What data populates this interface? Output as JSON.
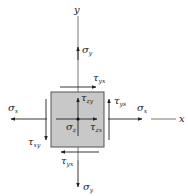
{
  "diagram": {
    "type": "stress-element",
    "axes": {
      "y_label": "y",
      "x_label": "x"
    },
    "element": {
      "fill": "#c8c8c8",
      "stroke": "#555555"
    },
    "labels": {
      "sigma_y_top": {
        "sym": "σ",
        "sub": "y"
      },
      "tau_yx_top": {
        "sym": "τ",
        "sub": "yx"
      },
      "tau_zy": {
        "sym": "τ",
        "sub": "zy"
      },
      "tau_ys": {
        "sym": "τ",
        "sub": "ys"
      },
      "sigma_x_right": {
        "sym": "σ",
        "sub": "x"
      },
      "sigma_x_left": {
        "sym": "σ",
        "sub": "x"
      },
      "sigma_z": {
        "sym": "σ",
        "sub": "z"
      },
      "tau_zx": {
        "sym": "τ",
        "sub": "zx"
      },
      "tau_xy": {
        "sym": "τ",
        "sub": "xy"
      },
      "tau_yx_bottom": {
        "sym": "τ",
        "sub": "yx"
      },
      "sigma_y_bottom": {
        "sym": "σ",
        "sub": "y"
      }
    },
    "colors": {
      "line": "#333333",
      "text": "#222222"
    }
  }
}
